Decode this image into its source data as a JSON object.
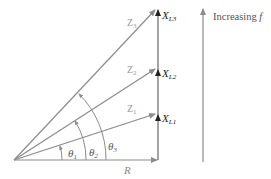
{
  "diagram": {
    "type": "impedance-phasor",
    "colors": {
      "line": "#8c8c8c",
      "dark": "#444444",
      "text": "#555555"
    },
    "labels": {
      "resistance": "R",
      "z1": "Z",
      "z1_sub": "1",
      "z2": "Z",
      "z2_sub": "2",
      "z3": "Z",
      "z3_sub": "3",
      "xl1": "X",
      "xl1_sub": "L1",
      "xl2": "X",
      "xl2_sub": "L2",
      "xl3": "X",
      "xl3_sub": "L3",
      "theta1": "θ",
      "theta1_sub": "1",
      "theta2": "θ",
      "theta2_sub": "2",
      "theta3": "θ",
      "theta3_sub": "3",
      "increasing": "Increasing ",
      "increasing_var": "f"
    }
  }
}
